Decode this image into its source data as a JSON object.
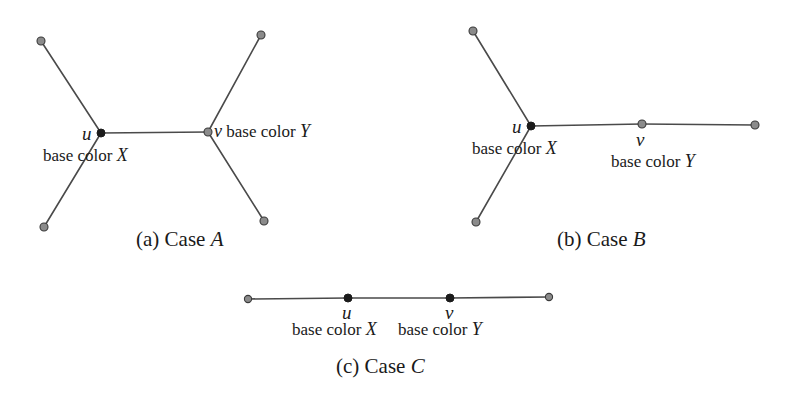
{
  "figure": {
    "title_text": "",
    "colors": {
      "edge": "#4a4a4a",
      "node_open_fill": "#8b8b8b",
      "node_open_stroke": "#3a3a3a",
      "node_solid": "#1b1b1b",
      "text": "#1a1a1a",
      "background": "#ffffff"
    },
    "subfigures": [
      {
        "id": "a",
        "caption_prefix": "(a)",
        "caption_word": "Case",
        "caption_letter": "A",
        "caption_full": "(a) Case A",
        "vertex_u_label": "u",
        "vertex_v_label": "v",
        "u_base_label": "base color X",
        "v_base_label": "v base color Y",
        "base_color_u": "X",
        "base_color_v": "Y"
      },
      {
        "id": "b",
        "caption_prefix": "(b)",
        "caption_word": "Case",
        "caption_letter": "B",
        "caption_full": "(b) Case B",
        "vertex_u_label": "u",
        "vertex_v_label": "v",
        "u_base_label": "base color X",
        "v_base_label": "base color Y",
        "base_color_u": "X",
        "base_color_v": "Y"
      },
      {
        "id": "c",
        "caption_prefix": "(c)",
        "caption_word": "Case",
        "caption_letter": "C",
        "caption_full": "(c) Case C",
        "vertex_u_label": "u",
        "vertex_v_label": "v",
        "u_base_label": "base color X",
        "v_base_label": "base color Y",
        "base_color_u": "X",
        "base_color_v": "Y"
      }
    ]
  },
  "chart_data": {
    "type": "diagram",
    "graphs": [
      {
        "name": "Case A",
        "description": "Two degree-3 vertices u and v joined by an edge, each with two pendant leaves",
        "nodes": [
          {
            "id": "a_leaf_tl",
            "x": 41,
            "y": 41,
            "style": "open"
          },
          {
            "id": "a_leaf_bl",
            "x": 44,
            "y": 227,
            "style": "open"
          },
          {
            "id": "a_u",
            "x": 101,
            "y": 133,
            "style": "solid",
            "label": "u"
          },
          {
            "id": "a_v",
            "x": 208,
            "y": 132,
            "style": "open",
            "label": "v"
          },
          {
            "id": "a_leaf_tr",
            "x": 261,
            "y": 35,
            "style": "open"
          },
          {
            "id": "a_leaf_br",
            "x": 264,
            "y": 221,
            "style": "open"
          }
        ],
        "edges": [
          [
            "a_leaf_tl",
            "a_u"
          ],
          [
            "a_leaf_bl",
            "a_u"
          ],
          [
            "a_u",
            "a_v"
          ],
          [
            "a_v",
            "a_leaf_tr"
          ],
          [
            "a_v",
            "a_leaf_br"
          ]
        ]
      },
      {
        "name": "Case B",
        "description": "Degree-3 vertex u with two pendant leaves, joined by a path through degree-2 vertex v to a leaf",
        "nodes": [
          {
            "id": "b_leaf_tl",
            "x": 473,
            "y": 31,
            "style": "open"
          },
          {
            "id": "b_leaf_bl",
            "x": 476,
            "y": 222,
            "style": "open"
          },
          {
            "id": "b_u",
            "x": 531,
            "y": 126,
            "style": "solid",
            "label": "u"
          },
          {
            "id": "b_v",
            "x": 642,
            "y": 124,
            "style": "open",
            "label": "v"
          },
          {
            "id": "b_leaf_r",
            "x": 755,
            "y": 125,
            "style": "open"
          }
        ],
        "edges": [
          [
            "b_leaf_tl",
            "b_u"
          ],
          [
            "b_leaf_bl",
            "b_u"
          ],
          [
            "b_u",
            "b_v"
          ],
          [
            "b_v",
            "b_leaf_r"
          ]
        ]
      },
      {
        "name": "Case C",
        "description": "A path of four vertices with u and v the two internal degree-2 vertices",
        "nodes": [
          {
            "id": "c_leaf_l",
            "x": 248,
            "y": 299,
            "style": "open"
          },
          {
            "id": "c_u",
            "x": 348,
            "y": 298,
            "style": "solid",
            "label": "u"
          },
          {
            "id": "c_v",
            "x": 450,
            "y": 298,
            "style": "solid",
            "label": "v"
          },
          {
            "id": "c_leaf_r",
            "x": 549,
            "y": 297,
            "style": "open"
          }
        ],
        "edges": [
          [
            "c_leaf_l",
            "c_u"
          ],
          [
            "c_u",
            "c_v"
          ],
          [
            "c_v",
            "c_leaf_r"
          ]
        ]
      }
    ]
  }
}
